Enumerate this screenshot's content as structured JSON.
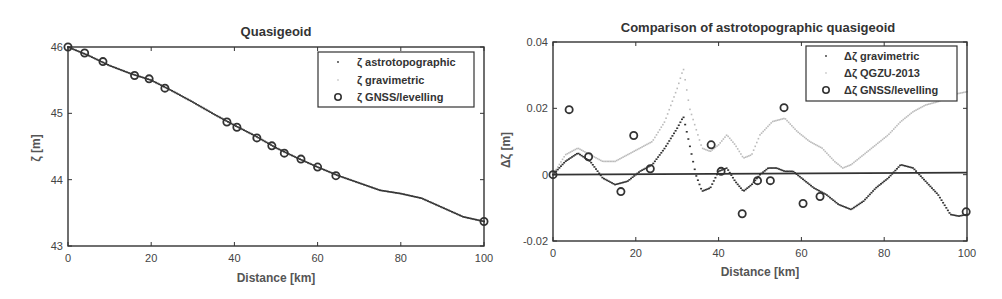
{
  "chart_data": [
    {
      "type": "line",
      "title": "Quasigeoid",
      "xlabel": "Distance [km]",
      "ylabel": "ζ [m]",
      "xlim": [
        0,
        100
      ],
      "ylim": [
        43,
        46
      ],
      "xticks": [
        "0",
        "20",
        "40",
        "60",
        "80",
        "100"
      ],
      "yticks": [
        "43",
        "44",
        "45",
        "46"
      ],
      "legend_position": "upper right",
      "series": [
        {
          "name": "ζ astrotopographic",
          "style": "dots-dark",
          "x": [
            0,
            5,
            10,
            15,
            20,
            25,
            30,
            35,
            40,
            45,
            50,
            55,
            60,
            65,
            70,
            75,
            80,
            85,
            90,
            95,
            100
          ],
          "y": [
            46.0,
            45.87,
            45.72,
            45.6,
            45.5,
            45.34,
            45.17,
            44.99,
            44.82,
            44.66,
            44.48,
            44.33,
            44.19,
            44.06,
            43.95,
            43.84,
            43.79,
            43.72,
            43.58,
            43.44,
            43.37
          ]
        },
        {
          "name": "ζ gravimetric",
          "style": "dots-light",
          "x": [
            0,
            5,
            10,
            15,
            20,
            25,
            30,
            35,
            40,
            45,
            50,
            55,
            60,
            65,
            70,
            75,
            80,
            85,
            90,
            95,
            100
          ],
          "y": [
            46.0,
            45.87,
            45.72,
            45.6,
            45.5,
            45.34,
            45.17,
            44.99,
            44.82,
            44.66,
            44.48,
            44.33,
            44.19,
            44.06,
            43.95,
            43.84,
            43.79,
            43.72,
            43.58,
            43.44,
            43.37
          ]
        },
        {
          "name": "ζ GNSS/levelling",
          "style": "circles",
          "x": [
            0,
            4,
            8.4,
            16,
            19.5,
            23.3,
            38.2,
            40.6,
            45.4,
            49,
            52,
            56,
            60,
            64.4,
            100
          ],
          "y": [
            46.0,
            45.91,
            45.78,
            45.57,
            45.52,
            45.38,
            44.87,
            44.79,
            44.63,
            44.51,
            44.4,
            44.31,
            44.19,
            44.06,
            43.37
          ]
        }
      ]
    },
    {
      "type": "line",
      "title": "Comparison of astrotopographic quasigeoid",
      "xlabel": "Distance [km]",
      "ylabel": "Δζ [m]",
      "xlim": [
        0,
        100
      ],
      "ylim": [
        -0.02,
        0.04
      ],
      "xticks": [
        "0",
        "20",
        "40",
        "60",
        "80",
        "100"
      ],
      "yticks": [
        "-0.02",
        "0",
        "0.02",
        "0.04"
      ],
      "legend_position": "upper right",
      "zero_line": true,
      "series": [
        {
          "name": "Δζ gravimetric",
          "style": "dots-dark",
          "x": [
            0,
            3,
            6,
            9,
            12,
            15,
            18,
            21,
            24,
            27,
            30,
            31.5,
            33,
            34.5,
            36,
            38,
            40,
            42,
            44,
            46,
            48,
            50,
            52,
            54,
            56,
            58,
            60,
            63,
            66,
            69,
            72,
            75,
            78,
            81,
            84,
            87,
            90,
            93,
            96,
            98,
            100
          ],
          "y": [
            0,
            0.004,
            0.0065,
            0.004,
            -0.001,
            -0.003,
            -0.002,
            0.001,
            0.003,
            0.008,
            0.014,
            0.0175,
            0.009,
            0.0,
            -0.005,
            -0.004,
            0.001,
            0.002,
            -0.002,
            -0.005,
            -0.003,
            0.0,
            0.002,
            0.002,
            0.001,
            0.001,
            -0.001,
            -0.004,
            -0.006,
            -0.009,
            -0.0105,
            -0.008,
            -0.004,
            -0.001,
            0.003,
            0.002,
            -0.002,
            -0.006,
            -0.012,
            -0.0125,
            -0.012
          ]
        },
        {
          "name": "Δζ QGZU-2013",
          "style": "dots-light",
          "x": [
            0,
            3,
            6,
            9,
            12,
            15,
            18,
            21,
            24,
            27,
            30,
            31.5,
            33,
            36,
            38,
            40,
            42,
            44,
            46,
            48,
            50,
            53,
            56,
            59,
            62,
            65,
            68,
            70,
            72,
            75,
            78,
            81,
            84,
            87,
            90,
            93,
            96,
            100
          ],
          "y": [
            0,
            0.006,
            0.008,
            0.006,
            0.004,
            0.004,
            0.006,
            0.008,
            0.01,
            0.016,
            0.026,
            0.032,
            0.02,
            0.008,
            0.007,
            0.009,
            0.012,
            0.009,
            0.005,
            0.006,
            0.012,
            0.016,
            0.017,
            0.013,
            0.01,
            0.008,
            0.004,
            0.002,
            0.003,
            0.006,
            0.009,
            0.012,
            0.016,
            0.019,
            0.021,
            0.022,
            0.024,
            0.025
          ]
        },
        {
          "name": "Δζ GNSS/levelling",
          "style": "circles",
          "x": [
            0,
            3.9,
            8.6,
            16.4,
            19.5,
            23.5,
            38.2,
            40.6,
            45.7,
            49.4,
            52.5,
            55.8,
            60.4,
            64.5,
            99.8
          ],
          "y": [
            0,
            0.0196,
            0.0054,
            -0.0051,
            0.0118,
            0.0018,
            0.009,
            0.001,
            -0.0118,
            -0.0018,
            -0.0018,
            0.0202,
            -0.0087,
            -0.0066,
            -0.0112
          ]
        }
      ]
    }
  ],
  "colors": {
    "axis": "#333333",
    "dark_series": "#333333",
    "light_series": "#bbbbbb",
    "circle": "#333333"
  },
  "legend_symbols": {
    "dot": "·",
    "circle": "o"
  }
}
